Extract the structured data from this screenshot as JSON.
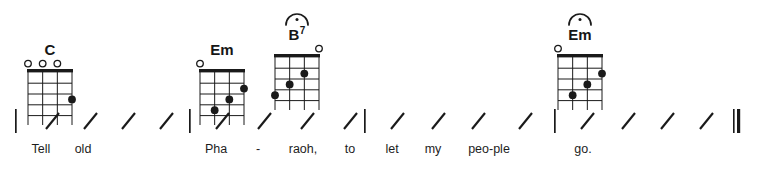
{
  "score": {
    "instrument": "ukulele",
    "strings": 4,
    "frets": 5,
    "time_slots_per_measure": 4,
    "ink_color": "#1a1a1a",
    "page_background": "#ffffff"
  },
  "chords": [
    {
      "id": "chord-c",
      "name": "C",
      "root": "C",
      "suffix": "",
      "fermata": false,
      "x": 18,
      "y": 26,
      "open_strings": [
        1,
        2,
        3
      ],
      "muted_strings": [],
      "dots": [
        {
          "string": 4,
          "fret": 3
        }
      ]
    },
    {
      "id": "chord-em-1",
      "name": "Em",
      "root": "E",
      "suffix": "m",
      "fermata": false,
      "x": 190,
      "y": 26,
      "open_strings": [
        1
      ],
      "muted_strings": [],
      "dots": [
        {
          "string": 2,
          "fret": 4
        },
        {
          "string": 3,
          "fret": 3
        },
        {
          "string": 4,
          "fret": 2
        }
      ]
    },
    {
      "id": "chord-b7",
      "name": "B7",
      "root": "B",
      "suffix": "7",
      "fermata": true,
      "x": 265,
      "y": 11,
      "open_strings": [
        4
      ],
      "muted_strings": [],
      "dots": [
        {
          "string": 1,
          "fret": 4
        },
        {
          "string": 2,
          "fret": 3
        },
        {
          "string": 3,
          "fret": 2
        }
      ]
    },
    {
      "id": "chord-em-2",
      "name": "Em",
      "root": "E",
      "suffix": "m",
      "fermata": true,
      "x": 548,
      "y": 11,
      "open_strings": [
        1
      ],
      "muted_strings": [],
      "dots": [
        {
          "string": 2,
          "fret": 4
        },
        {
          "string": 3,
          "fret": 3
        },
        {
          "string": 4,
          "fret": 2
        }
      ]
    }
  ],
  "staff": {
    "barlines": [
      {
        "id": "barline-1",
        "x": 15,
        "type": "single"
      },
      {
        "id": "barline-2",
        "x": 189,
        "type": "single"
      },
      {
        "id": "barline-3",
        "x": 364,
        "type": "single"
      },
      {
        "id": "barline-4",
        "x": 554,
        "type": "single"
      },
      {
        "id": "barline-final",
        "x": 733,
        "type": "final"
      }
    ],
    "slashes": [
      {
        "id": "slash-1-1",
        "measure": 1,
        "beat": 1,
        "x": 46
      },
      {
        "id": "slash-1-2",
        "measure": 1,
        "beat": 2,
        "x": 84
      },
      {
        "id": "slash-1-3",
        "measure": 1,
        "beat": 3,
        "x": 122
      },
      {
        "id": "slash-1-4",
        "measure": 1,
        "beat": 4,
        "x": 160
      },
      {
        "id": "slash-2-1",
        "measure": 2,
        "beat": 1,
        "x": 216
      },
      {
        "id": "slash-2-2",
        "measure": 2,
        "beat": 2,
        "x": 258
      },
      {
        "id": "slash-2-3",
        "measure": 2,
        "beat": 3,
        "x": 301
      },
      {
        "id": "slash-2-4",
        "measure": 2,
        "beat": 4,
        "x": 344
      },
      {
        "id": "slash-3-1",
        "measure": 3,
        "beat": 1,
        "x": 391
      },
      {
        "id": "slash-3-2",
        "measure": 3,
        "beat": 2,
        "x": 432
      },
      {
        "id": "slash-3-3",
        "measure": 3,
        "beat": 3,
        "x": 472
      },
      {
        "id": "slash-3-4",
        "measure": 3,
        "beat": 4,
        "x": 519
      },
      {
        "id": "slash-4-1",
        "measure": 4,
        "beat": 1,
        "x": 581
      },
      {
        "id": "slash-4-2",
        "measure": 4,
        "beat": 2,
        "x": 622
      },
      {
        "id": "slash-4-3",
        "measure": 4,
        "beat": 3,
        "x": 661
      },
      {
        "id": "slash-4-4",
        "measure": 4,
        "beat": 4,
        "x": 700
      }
    ]
  },
  "lyrics": [
    {
      "id": "lyric-tell",
      "text": "Tell",
      "x": 41
    },
    {
      "id": "lyric-old",
      "text": "old",
      "x": 83
    },
    {
      "id": "lyric-pha",
      "text": "Pha",
      "x": 216
    },
    {
      "id": "lyric-dash",
      "text": "-",
      "x": 258
    },
    {
      "id": "lyric-raoh",
      "text": "raoh,",
      "x": 303
    },
    {
      "id": "lyric-to",
      "text": "to",
      "x": 350
    },
    {
      "id": "lyric-let",
      "text": "let",
      "x": 392
    },
    {
      "id": "lyric-my",
      "text": "my",
      "x": 433
    },
    {
      "id": "lyric-people",
      "text": "peo-ple",
      "x": 489
    },
    {
      "id": "lyric-go",
      "text": "go.",
      "x": 583
    }
  ],
  "lyrics_full_line": "Tell old Pha - raoh, to let my peo-ple go."
}
